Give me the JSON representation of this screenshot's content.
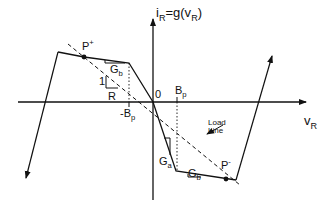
{
  "diagram": {
    "y_axis_label": {
      "base": "i",
      "sub": "R",
      "rest": "=g(v",
      "sub2": "R",
      "close": ")"
    },
    "x_axis_label": {
      "base": "v",
      "sub": "R"
    },
    "origin_label": "0",
    "point_p_plus": {
      "base": "P",
      "sup": "+"
    },
    "point_p_minus": {
      "base": "P",
      "sup": "-"
    },
    "gb_upper": {
      "base": "G",
      "sub": "b"
    },
    "gb_lower": {
      "base": "G",
      "sub": "b"
    },
    "ga_label": {
      "base": "G",
      "sub": "a"
    },
    "slope_one": "1",
    "slope_r": "R",
    "bp_pos": {
      "base": "B",
      "sub": "p"
    },
    "bp_neg": {
      "base": "-B",
      "sub": "p"
    },
    "load_line_label_1": "Load",
    "load_line_label_2": "Line",
    "colors": {
      "stroke": "#111111",
      "background": "#ffffff"
    }
  }
}
